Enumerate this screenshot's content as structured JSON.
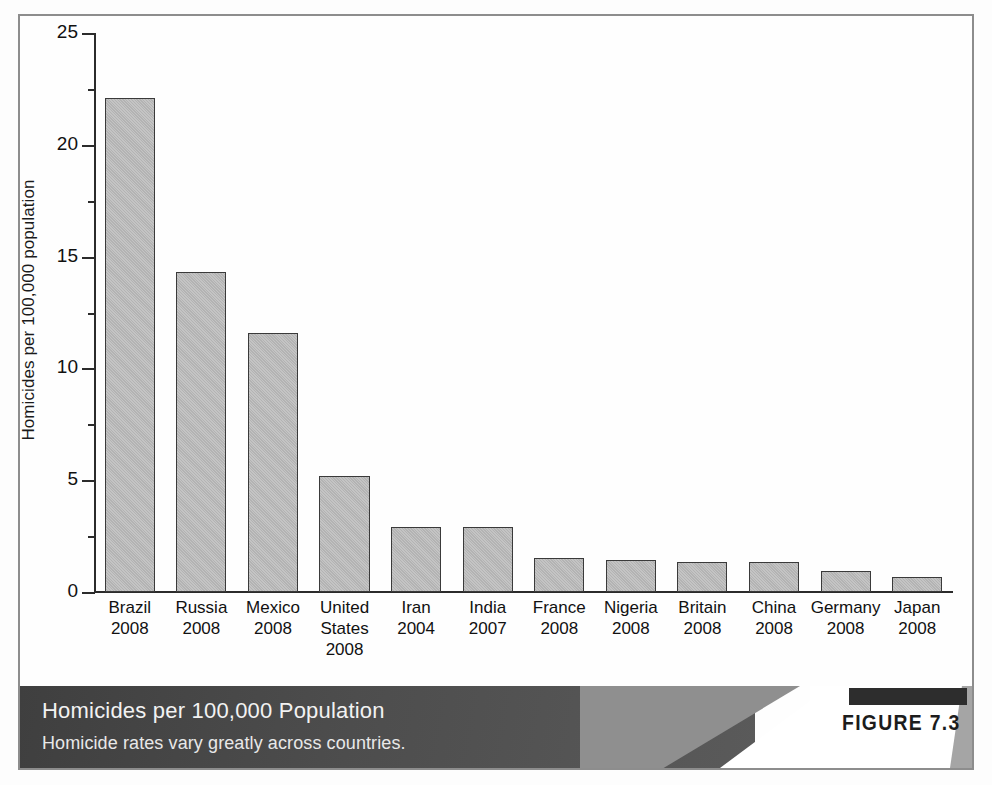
{
  "figure": {
    "badge_bar": "figure-badge-bar",
    "badge_label": "FIGURE 7.3",
    "caption_title": "Homicides per 100,000 Population",
    "caption_subtitle": "Homicide rates vary greatly across countries."
  },
  "colors": {
    "bar_fill": "#b7b7b7",
    "bar_stroke": "#3a3a3a",
    "axis": "#2b2b2b",
    "frame": "#8d8d8d",
    "caption_dark": "#4d4d4d",
    "caption_mid": "#8f8f8f",
    "badge_bar": "#2d2d2d",
    "caption_text": "#f2f2f2"
  },
  "chart_data": {
    "type": "bar",
    "title": "Homicides per 100,000 Population",
    "subtitle": "Homicide rates vary greatly across countries.",
    "xlabel": "",
    "ylabel": "Homicides per 100,000 population",
    "ylim": [
      0,
      25
    ],
    "yticks": [
      0,
      5,
      10,
      15,
      20,
      25
    ],
    "ytick_labels": [
      "0",
      "5",
      "10",
      "15",
      "20",
      "25"
    ],
    "grid": false,
    "legend": false,
    "categories": [
      "Brazil 2008",
      "Russia 2008",
      "Mexico 2008",
      "United States 2008",
      "Iran 2004",
      "India 2007",
      "France 2008",
      "Nigeria 2008",
      "Britain 2008",
      "China 2008",
      "Germany 2008",
      "Japan 2008"
    ],
    "category_lines": [
      [
        "Brazil",
        "2008"
      ],
      [
        "Russia",
        "2008"
      ],
      [
        "Mexico",
        "2008"
      ],
      [
        "United",
        "States",
        "2008"
      ],
      [
        "Iran",
        "2004"
      ],
      [
        "India",
        "2007"
      ],
      [
        "France",
        "2008"
      ],
      [
        "Nigeria",
        "2008"
      ],
      [
        "Britain",
        "2008"
      ],
      [
        "China",
        "2008"
      ],
      [
        "Germany",
        "2008"
      ],
      [
        "Japan",
        "2008"
      ]
    ],
    "values": [
      22.1,
      14.3,
      11.6,
      5.2,
      2.9,
      2.9,
      1.5,
      1.45,
      1.35,
      1.35,
      0.95,
      0.65
    ]
  }
}
